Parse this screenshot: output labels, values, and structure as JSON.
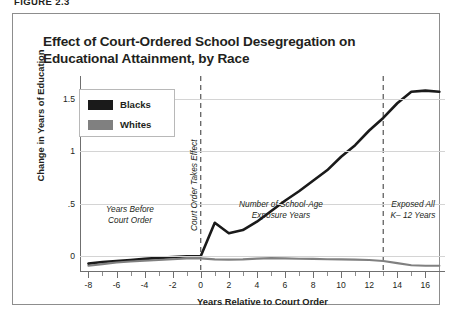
{
  "figure_label": "FIGURE 2.3",
  "title": "Effect of Court-Ordered School Desegregation on Educational Attainment, by Race",
  "legend": {
    "items": [
      {
        "label": "Blacks",
        "color": "#1a1a1a"
      },
      {
        "label": "Whites",
        "color": "#808080"
      }
    ]
  },
  "annotations": {
    "before": "Years Before\nCourt Order",
    "vline_left": "Court Order Takes Effect",
    "middle": "Number of School-Age\nExposure Years",
    "right": "Exposed All\nK– 12 Years"
  },
  "axes": {
    "y_title": "Change in Years of Education",
    "x_title": "Years Relative to Court Order",
    "y_ticks": [
      "1.5",
      "1",
      ".5",
      "0"
    ],
    "x_ticks": [
      "-8",
      "-6",
      "-4",
      "-2",
      "0",
      "2",
      "4",
      "6",
      "8",
      "10",
      "12",
      "14",
      "16"
    ]
  },
  "chart_data": {
    "type": "line",
    "title": "Effect of Court-Ordered School Desegregation on Educational Attainment, by Race",
    "xlabel": "Years Relative to Court Order",
    "ylabel": "Change in Years of Education",
    "xlim": [
      -8.6,
      17.4
    ],
    "ylim": [
      -0.15,
      1.72
    ],
    "ytick_values": [
      0,
      0.5,
      1,
      1.5
    ],
    "xtick_values": [
      -8,
      -6,
      -4,
      -2,
      0,
      2,
      4,
      6,
      8,
      10,
      12,
      14,
      16
    ],
    "xtick_minor_step": 1,
    "grid": "horizontal",
    "legend_position": "upper-left-inside",
    "reference_lines": [
      {
        "x": 0,
        "style": "dashed",
        "label": "Court Order Takes Effect"
      },
      {
        "x": 13,
        "style": "dashed",
        "label": ""
      }
    ],
    "x": [
      -8,
      -7,
      -6,
      -5,
      -4,
      -3,
      -2,
      -1,
      0,
      1,
      2,
      3,
      4,
      5,
      6,
      7,
      8,
      9,
      10,
      11,
      12,
      13,
      14,
      15,
      16,
      17
    ],
    "series": [
      {
        "name": "Blacks",
        "color": "#1a1a1a",
        "values": [
          -0.07,
          -0.055,
          -0.045,
          -0.035,
          -0.025,
          -0.015,
          -0.008,
          0.0,
          0.0,
          0.32,
          0.22,
          0.25,
          0.33,
          0.43,
          0.53,
          0.62,
          0.72,
          0.82,
          0.95,
          1.06,
          1.2,
          1.32,
          1.46,
          1.57,
          1.58,
          1.57
        ]
      },
      {
        "name": "Whites",
        "color": "#808080",
        "values": [
          -0.09,
          -0.075,
          -0.06,
          -0.05,
          -0.042,
          -0.035,
          -0.028,
          -0.02,
          -0.02,
          -0.03,
          -0.032,
          -0.03,
          -0.022,
          -0.018,
          -0.02,
          -0.023,
          -0.025,
          -0.028,
          -0.03,
          -0.032,
          -0.035,
          -0.045,
          -0.065,
          -0.085,
          -0.09,
          -0.09
        ]
      }
    ]
  }
}
